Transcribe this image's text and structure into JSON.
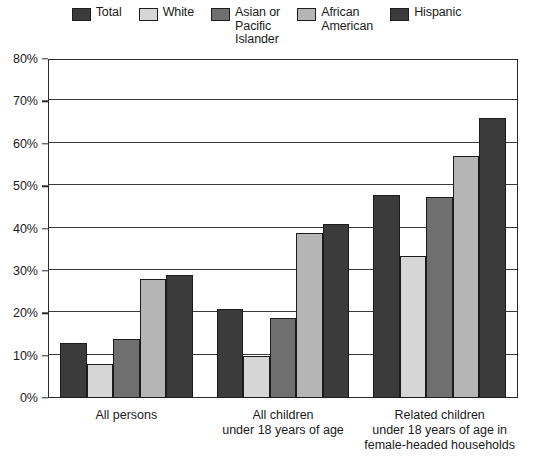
{
  "chart_data": {
    "type": "bar",
    "title": "",
    "xlabel": "",
    "ylabel": "",
    "ylim": [
      0,
      80
    ],
    "ytick_labels": [
      "0%",
      "10%",
      "20%",
      "30%",
      "40%",
      "50%",
      "60%",
      "70%",
      "80%"
    ],
    "ytick_values": [
      0,
      10,
      20,
      30,
      40,
      50,
      60,
      70,
      80
    ],
    "grid": true,
    "legend_position": "top",
    "categories": [
      "All persons",
      "All children\nunder 18 years of age",
      "Related children\nunder 18 years of age in\nfemale-headed households"
    ],
    "series": [
      {
        "name": "Total",
        "color": "#3b3b3b",
        "values": [
          13,
          21,
          48
        ]
      },
      {
        "name": "White",
        "color": "#d6d6d6",
        "values": [
          8,
          10,
          33.5
        ]
      },
      {
        "name": "Asian or\nPacific\nIslander",
        "color": "#6f6f6f",
        "values": [
          14,
          19,
          47.5
        ]
      },
      {
        "name": "African\nAmerican",
        "color": "#b5b5b5",
        "values": [
          28,
          39,
          57
        ]
      },
      {
        "name": "Hispanic",
        "color": "#3b3b3b",
        "values": [
          29,
          41,
          66
        ]
      }
    ]
  },
  "legend": {
    "items": [
      {
        "label": "Total",
        "color": "#3b3b3b"
      },
      {
        "label": "White",
        "color": "#d6d6d6"
      },
      {
        "label": "Asian or\nPacific\nIslander",
        "color": "#6f6f6f"
      },
      {
        "label": "African\nAmerican",
        "color": "#b5b5b5"
      },
      {
        "label": "Hispanic",
        "color": "#3b3b3b"
      }
    ]
  }
}
